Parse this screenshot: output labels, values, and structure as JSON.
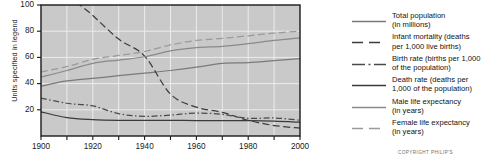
{
  "chart_data": {
    "type": "line",
    "title": "",
    "xlabel": "",
    "ylabel": "Units specified in legend",
    "xlim": [
      1900,
      2000
    ],
    "ylim": [
      0,
      100
    ],
    "grid": true,
    "legend_position": "right",
    "x_ticks": [
      1900,
      1920,
      1940,
      1960,
      1980,
      2000
    ],
    "x_minor_ticks": [
      1910,
      1930,
      1950,
      1970,
      1990
    ],
    "y_ticks": [
      20,
      40,
      60,
      80,
      100
    ],
    "x": [
      1900,
      1910,
      1920,
      1930,
      1940,
      1950,
      1960,
      1970,
      1980,
      1990,
      2000
    ],
    "series": [
      {
        "name": "Total population (in millions)",
        "style": "solid",
        "color": "#7a7a7a",
        "values": [
          38,
          42,
          44,
          46,
          48,
          50,
          52.5,
          55.5,
          56,
          57.5,
          59
        ]
      },
      {
        "name": "Infant mortality (deaths per 1,000 live births)",
        "style": "dashed",
        "color": "#3c3c3c",
        "values": [
          142,
          110,
          92,
          74,
          61,
          32,
          22,
          18,
          12,
          8,
          6
        ]
      },
      {
        "name": "Birth rate (births per 1,000 of the population)",
        "style": "dashdot",
        "color": "#4a4a4a",
        "values": [
          29,
          25,
          23,
          17,
          15,
          16,
          17.5,
          16.5,
          13.5,
          13.8,
          12
        ]
      },
      {
        "name": "Death rate (deaths per 1,000 of the population)",
        "style": "solid",
        "color": "#3a3a3a",
        "values": [
          18.5,
          14,
          12.5,
          12,
          12,
          12,
          11.8,
          11.8,
          11.7,
          11.3,
          10.5
        ]
      },
      {
        "name": "Male life expectancy (in years)",
        "style": "solid",
        "color": "#8a8a8a",
        "values": [
          45,
          50,
          55.5,
          58,
          60.5,
          65,
          67.5,
          68.5,
          70.5,
          73,
          75
        ]
      },
      {
        "name": "Female life expectancy (in years)",
        "style": "dashed",
        "color": "#9a9a9a",
        "values": [
          49,
          53,
          58.5,
          61.5,
          64.5,
          69.5,
          73,
          74.5,
          76.5,
          78.5,
          80
        ]
      }
    ]
  },
  "axis": {
    "ylabel": "Units specified in legend",
    "y_tick_labels": [
      "100",
      "80",
      "60",
      "40",
      "20"
    ],
    "x_tick_labels": [
      "1900",
      "1920",
      "1940",
      "1960",
      "1980",
      "2000"
    ]
  },
  "legend": {
    "entries": [
      {
        "label": "Total population\n(in millions)",
        "line1": "Total population",
        "line2": "(in millions)",
        "style": "solid",
        "color": "#7a7a7a"
      },
      {
        "label": "Infant mortality (deaths per 1,000 live births)",
        "line1": "Infant mortality (deaths",
        "line2": "per 1,000 live births)",
        "style": "dashed",
        "color": "#3c3c3c"
      },
      {
        "label": "Birth rate (births per 1,000 of the population)",
        "line1": "Birth rate (births per 1,000",
        "line2": "of the population)",
        "style": "dashdot",
        "color": "#4a4a4a"
      },
      {
        "label": "Death rate (deaths per 1,000 of the population)",
        "line1": "Death rate (deaths per",
        "line2": "1,000 of the population)",
        "style": "solid",
        "color": "#3a3a3a"
      },
      {
        "label": "Male life expectancy (in years)",
        "line1": "Male life expectancy",
        "line2": "(in years)",
        "style": "solid",
        "color": "#8a8a8a"
      },
      {
        "label": "Female life expectancy (in years)",
        "line1": "Female life expectancy",
        "line2": "(in years)",
        "style": "dashed",
        "color": "#9a9a9a"
      }
    ]
  },
  "footer": {
    "copyright": "COPYRIGHT PHILIP'S"
  },
  "colors": {
    "plot_background": "#c9c9c9",
    "grid": "#ececec",
    "frame": "#1a1a1a",
    "page_background": "#ffffff"
  }
}
